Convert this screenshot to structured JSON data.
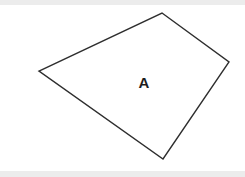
{
  "canvas": {
    "width": 245,
    "height": 177,
    "background_color": "#ffffff",
    "top_band_color": "#ececec",
    "bottom_band_color": "#ececec"
  },
  "figure": {
    "name": "quadrilateral",
    "label": "A",
    "label_position": {
      "x": 144,
      "y": 84
    },
    "stroke_color": "#2e2e2e",
    "stroke_width": 1.4,
    "fill_color": "#ffffff",
    "vertices": [
      {
        "name": "top",
        "x": 162,
        "y": 13
      },
      {
        "name": "right",
        "x": 229,
        "y": 62
      },
      {
        "name": "bottom",
        "x": 163,
        "y": 159
      },
      {
        "name": "left",
        "x": 39,
        "y": 71
      }
    ],
    "points_attr": "162,13 229,62 163,159 39,71"
  }
}
